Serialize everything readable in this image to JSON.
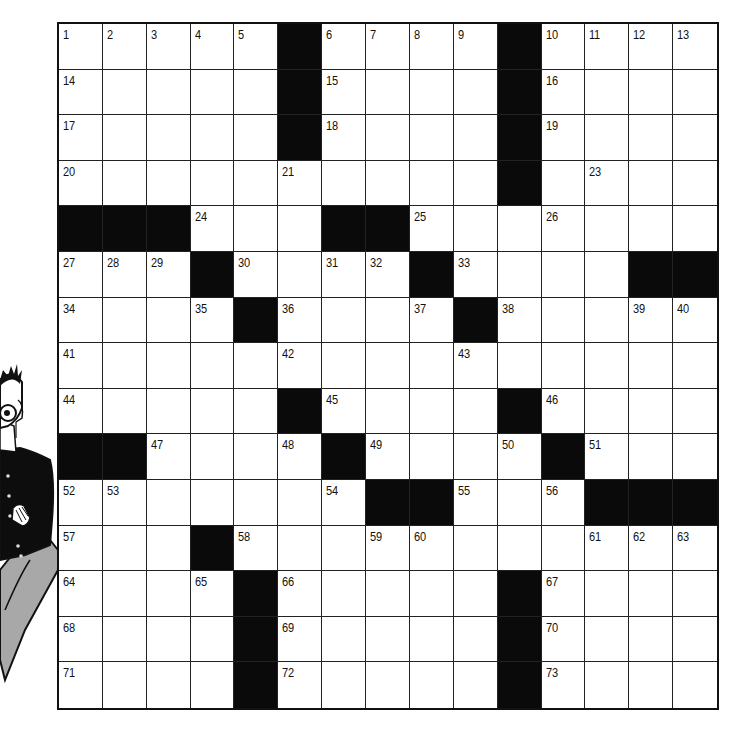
{
  "puzzle": {
    "rows": 15,
    "cols": 15,
    "layout": [
      "#####.####.####",
      "#####.####.####",
      "#####.####.####",
      "##########.####",
      "...###..#######",
      "###.####.####..",
      "####.####.#####",
      "###############",
      "#####.####.####",
      "..####.####.###",
      "#######..###...",
      "###.###########",
      "####.#####.####",
      "####.#####.####",
      "####.#####.####"
    ],
    "layout_legend": "'#' = white (open) cell, '.' = black block",
    "numbers": [
      [
        1,
        2,
        3,
        4,
        5,
        0,
        6,
        7,
        8,
        9,
        0,
        10,
        11,
        12,
        13
      ],
      [
        14,
        0,
        0,
        0,
        0,
        0,
        15,
        0,
        0,
        0,
        0,
        16,
        0,
        0,
        0
      ],
      [
        17,
        0,
        0,
        0,
        0,
        0,
        18,
        0,
        0,
        0,
        0,
        19,
        0,
        0,
        0
      ],
      [
        20,
        0,
        0,
        0,
        0,
        21,
        0,
        0,
        0,
        0,
        22,
        0,
        23,
        0,
        0
      ],
      [
        0,
        0,
        0,
        24,
        0,
        0,
        0,
        0,
        25,
        0,
        0,
        26,
        0,
        0,
        0
      ],
      [
        27,
        28,
        29,
        0,
        30,
        0,
        31,
        32,
        0,
        33,
        0,
        0,
        0,
        0,
        0
      ],
      [
        34,
        0,
        0,
        35,
        0,
        36,
        0,
        0,
        37,
        0,
        38,
        0,
        0,
        39,
        40
      ],
      [
        41,
        0,
        0,
        0,
        0,
        42,
        0,
        0,
        0,
        43,
        0,
        0,
        0,
        0,
        0
      ],
      [
        44,
        0,
        0,
        0,
        0,
        0,
        45,
        0,
        0,
        0,
        0,
        46,
        0,
        0,
        0
      ],
      [
        0,
        0,
        47,
        0,
        0,
        48,
        0,
        49,
        0,
        0,
        50,
        0,
        51,
        0,
        0
      ],
      [
        52,
        53,
        0,
        0,
        0,
        0,
        54,
        0,
        0,
        55,
        0,
        56,
        0,
        0,
        0
      ],
      [
        57,
        0,
        0,
        0,
        58,
        0,
        0,
        59,
        60,
        0,
        0,
        0,
        61,
        62,
        63
      ],
      [
        64,
        0,
        0,
        65,
        0,
        66,
        0,
        0,
        0,
        0,
        0,
        67,
        0,
        0,
        0
      ],
      [
        68,
        0,
        0,
        0,
        0,
        69,
        0,
        0,
        0,
        0,
        0,
        70,
        0,
        0,
        0
      ],
      [
        71,
        0,
        0,
        0,
        0,
        72,
        0,
        0,
        0,
        0,
        0,
        73,
        0,
        0,
        0
      ]
    ],
    "letters": []
  },
  "illustration": {
    "name": "cartoon-man-leaning",
    "colors": {
      "ink": "#111111",
      "jacket": "#0d0d0d",
      "pants": "#a8a8a8",
      "skin": "#ffffff"
    }
  },
  "colors": {
    "grid_line": "#222222",
    "block": "#0a0a0a",
    "cell": "#ffffff"
  }
}
